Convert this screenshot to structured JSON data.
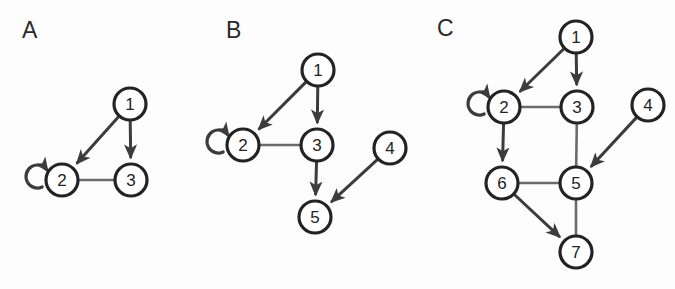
{
  "figure": {
    "background_color": "#fdfdfd",
    "node_fill": "#ffffff",
    "node_stroke": "#232323",
    "directed_edge_color": "#3c3c3c",
    "undirected_edge_color": "#6b6b6b",
    "node_radius": 16
  },
  "panels": [
    {
      "id": "panel-a",
      "label": "A",
      "label_pos": {
        "x": 22,
        "y": 38
      },
      "nodes": [
        {
          "id": "1",
          "label": "1",
          "x": 130,
          "y": 104
        },
        {
          "id": "2",
          "label": "2",
          "x": 62,
          "y": 180
        },
        {
          "id": "3",
          "label": "3",
          "x": 131,
          "y": 180
        }
      ],
      "edges": [
        {
          "from": "1",
          "to": "2",
          "directed": true
        },
        {
          "from": "1",
          "to": "3",
          "directed": true
        },
        {
          "from": "2",
          "to": "3",
          "directed": false
        }
      ],
      "self_loops": [
        {
          "node": "2",
          "side": "left"
        }
      ]
    },
    {
      "id": "panel-b",
      "label": "B",
      "label_pos": {
        "x": 226,
        "y": 38
      },
      "nodes": [
        {
          "id": "1",
          "label": "1",
          "x": 318,
          "y": 70
        },
        {
          "id": "2",
          "label": "2",
          "x": 243,
          "y": 145
        },
        {
          "id": "3",
          "label": "3",
          "x": 317,
          "y": 145
        },
        {
          "id": "4",
          "label": "4",
          "x": 390,
          "y": 148
        },
        {
          "id": "5",
          "label": "5",
          "x": 315,
          "y": 217
        }
      ],
      "edges": [
        {
          "from": "1",
          "to": "2",
          "directed": true
        },
        {
          "from": "1",
          "to": "3",
          "directed": true
        },
        {
          "from": "2",
          "to": "3",
          "directed": false
        },
        {
          "from": "3",
          "to": "5",
          "directed": true
        },
        {
          "from": "4",
          "to": "5",
          "directed": true
        }
      ],
      "self_loops": [
        {
          "node": "2",
          "side": "left"
        }
      ]
    },
    {
      "id": "panel-c",
      "label": "C",
      "label_pos": {
        "x": 437,
        "y": 36
      },
      "nodes": [
        {
          "id": "1",
          "label": "1",
          "x": 576,
          "y": 37
        },
        {
          "id": "2",
          "label": "2",
          "x": 504,
          "y": 107
        },
        {
          "id": "3",
          "label": "3",
          "x": 577,
          "y": 107
        },
        {
          "id": "4",
          "label": "4",
          "x": 648,
          "y": 105
        },
        {
          "id": "5",
          "label": "5",
          "x": 576,
          "y": 183
        },
        {
          "id": "6",
          "label": "6",
          "x": 502,
          "y": 183
        },
        {
          "id": "7",
          "label": "7",
          "x": 576,
          "y": 252
        }
      ],
      "edges": [
        {
          "from": "1",
          "to": "2",
          "directed": true
        },
        {
          "from": "1",
          "to": "3",
          "directed": true
        },
        {
          "from": "2",
          "to": "3",
          "directed": false
        },
        {
          "from": "2",
          "to": "6",
          "directed": true
        },
        {
          "from": "3",
          "to": "5",
          "directed": false
        },
        {
          "from": "4",
          "to": "5",
          "directed": true
        },
        {
          "from": "6",
          "to": "5",
          "directed": false
        },
        {
          "from": "6",
          "to": "7",
          "directed": true
        },
        {
          "from": "5",
          "to": "7",
          "directed": false
        }
      ],
      "self_loops": [
        {
          "node": "2",
          "side": "left"
        }
      ]
    }
  ]
}
